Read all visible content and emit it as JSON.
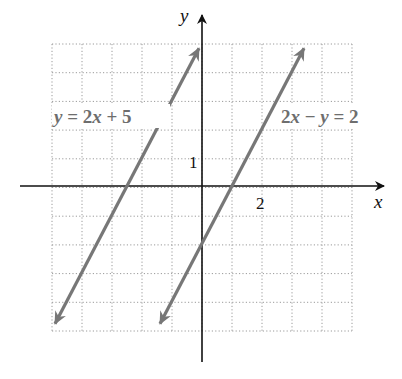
{
  "chart_data": {
    "type": "line",
    "title": "",
    "xlabel": "x",
    "ylabel": "y",
    "xlim": [
      -5,
      5
    ],
    "ylim": [
      -5,
      5
    ],
    "grid": true,
    "grid_style": "dotted",
    "x_tick_labels": [
      {
        "value": 2,
        "label": "2"
      }
    ],
    "y_tick_labels": [
      {
        "value": 1,
        "label": "1"
      }
    ],
    "series": [
      {
        "name": "y = 2x + 5",
        "equation": "y = 2x + 5",
        "slope": 2,
        "intercept": 5,
        "x": [
          -4.9,
          -0.1
        ],
        "y": [
          -4.8,
          4.8
        ],
        "arrows": "both",
        "color": "#777777"
      },
      {
        "name": "2x − y = 2",
        "equation": "2x − y = 2",
        "slope": 2,
        "intercept": -2,
        "x": [
          -1.4,
          3.4
        ],
        "y": [
          -4.8,
          4.8
        ],
        "arrows": "both",
        "color": "#777777"
      }
    ],
    "annotations": [
      {
        "text": "y = 2x + 5",
        "near_series": 0,
        "position": "upper-left"
      },
      {
        "text": "2x − y = 2",
        "near_series": 1,
        "position": "upper-right"
      }
    ]
  },
  "labels": {
    "x_axis": "x",
    "y_axis": "y",
    "tick_x": "2",
    "tick_y": "1",
    "eq1": {
      "var": "y",
      "rest": " = 2",
      "var2": "x",
      "rest2": " + 5"
    },
    "eq2": {
      "pre": "2",
      "var": "x",
      "mid": " − ",
      "var2": "y",
      "rest": " = 2"
    }
  },
  "colors": {
    "axis": "#111111",
    "line": "#777777",
    "grid": "#9a9a9a",
    "label": "#6e6e6e"
  }
}
